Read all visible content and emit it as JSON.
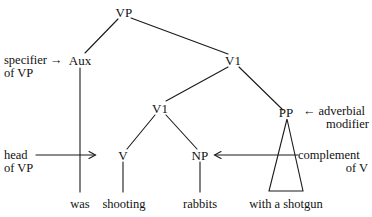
{
  "diagram": {
    "background_color": "#ffffff",
    "line_color": "#1a1a1a"
  },
  "nodes": {
    "vp": "VP",
    "aux": "Aux",
    "v1_upper": "V1",
    "v1_lower": "V1",
    "v": "V",
    "np": "NP",
    "pp": "PP"
  },
  "terminals": {
    "was": "was",
    "shooting": "shooting",
    "rabbits": "rabbits",
    "with_a_shotgun": "with a shotgun"
  },
  "annotations": {
    "specifier": {
      "line1": "specifier",
      "line2": "of VP",
      "arrow": "→"
    },
    "head": {
      "line1": "head",
      "line2": "of VP",
      "arrow": "→"
    },
    "adverbial": {
      "line1": "adverbial",
      "line2": "modifier",
      "arrow": "←"
    },
    "complement": {
      "line1": "complement",
      "line2": "of V",
      "arrow": "←"
    }
  }
}
